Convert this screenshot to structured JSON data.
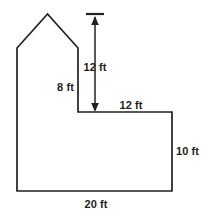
{
  "figure": {
    "units": "ft",
    "stroke_color": "#231f20",
    "fill_color": "#ffffff",
    "background_color": "#ffffff",
    "labels": {
      "roof_height": "12 ft",
      "wall_height": "8 ft",
      "ledge_width": "12 ft",
      "right_height": "10 ft",
      "base_width": "20 ft"
    },
    "outline_points": "47.5,14 17,48 17,191 172,191 172,112 78,112 78,48",
    "dimension_arrow": {
      "x": 95,
      "tick_y": 14,
      "tick_x1": 86,
      "tick_x2": 104,
      "top_y": 16,
      "bottom_y": 112
    },
    "label_positions": {
      "roof_height": {
        "x": 95,
        "y": 67,
        "align": "center"
      },
      "wall_height": {
        "x": 74,
        "y": 87,
        "align": "right"
      },
      "ledge_width": {
        "x": 131,
        "y": 105,
        "align": "center"
      },
      "right_height": {
        "x": 176,
        "y": 151,
        "align": "left"
      },
      "base_width": {
        "x": 96,
        "y": 204,
        "align": "center"
      }
    }
  }
}
